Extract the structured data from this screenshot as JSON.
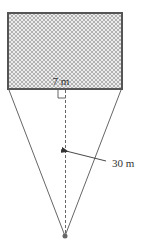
{
  "figure": {
    "labels": {
      "width": "7 m",
      "distance": "30 m"
    },
    "colors": {
      "line": "#555555",
      "rectangle_border": "#555555",
      "hatch": "#9a9a9a",
      "hatch_bg": "#ececec",
      "vertex_dot": "#666666",
      "text": "#333333"
    },
    "annotations": {
      "right_angle_marker": true,
      "dashed_perpendicular": true,
      "arrow_to_dashed_line": true
    }
  }
}
